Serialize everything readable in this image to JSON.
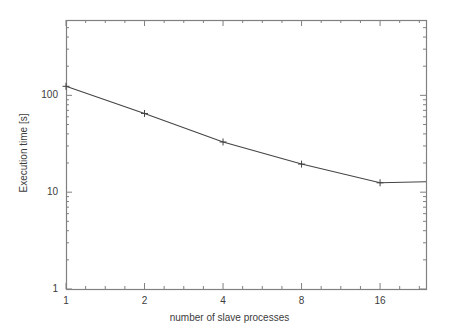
{
  "chart_data": {
    "type": "line",
    "title": "",
    "xlabel": "number of slave processes",
    "ylabel": "Execution time [s]",
    "xscale": "log2",
    "yscale": "log10",
    "xlim": [
      1,
      24
    ],
    "ylim": [
      1,
      600
    ],
    "grid": false,
    "legend": null,
    "xticks": [
      "1",
      "2",
      "4",
      "8",
      "16"
    ],
    "xtick_values": [
      1,
      2,
      4,
      8,
      16
    ],
    "yticks": [
      "1",
      "10",
      "100"
    ],
    "ytick_values": [
      1,
      10,
      100
    ],
    "marker": "plus",
    "line_color": "#444444",
    "frame_color": "#808080",
    "background": "#ffffff",
    "series": [
      {
        "name": "execution time",
        "x": [
          1,
          2,
          4,
          8,
          16,
          24
        ],
        "values": [
          124,
          65,
          33,
          19.5,
          12.5,
          12.8
        ]
      }
    ]
  }
}
